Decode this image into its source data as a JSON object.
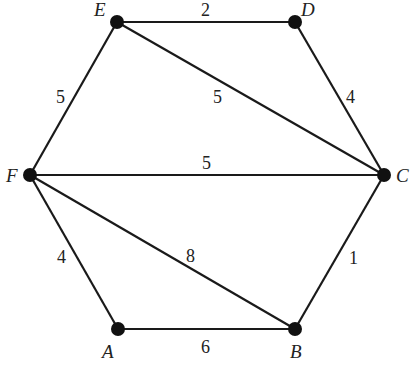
{
  "diagram": {
    "type": "weighted-undirected-graph",
    "nodes": [
      {
        "id": "A",
        "label": "A",
        "x": 118,
        "y": 329,
        "lx": 102,
        "ly": 358
      },
      {
        "id": "B",
        "label": "B",
        "x": 295,
        "y": 329,
        "lx": 290,
        "ly": 358
      },
      {
        "id": "C",
        "label": "C",
        "x": 384,
        "y": 175,
        "lx": 396,
        "ly": 182
      },
      {
        "id": "D",
        "label": "D",
        "x": 295,
        "y": 22,
        "lx": 301,
        "ly": 16
      },
      {
        "id": "E",
        "label": "E",
        "x": 117,
        "y": 22,
        "lx": 94,
        "ly": 16
      },
      {
        "id": "F",
        "label": "F",
        "x": 30,
        "y": 175,
        "lx": 6,
        "ly": 182
      }
    ],
    "edges": [
      {
        "from": "E",
        "to": "D",
        "weight": "2",
        "wx": 201,
        "wy": 16
      },
      {
        "from": "D",
        "to": "C",
        "weight": "4",
        "wx": 346,
        "wy": 103
      },
      {
        "from": "E",
        "to": "C",
        "weight": "5",
        "wx": 213,
        "wy": 103
      },
      {
        "from": "E",
        "to": "F",
        "weight": "5",
        "wx": 56,
        "wy": 103
      },
      {
        "from": "F",
        "to": "C",
        "weight": "5",
        "wx": 202,
        "wy": 169
      },
      {
        "from": "F",
        "to": "A",
        "weight": "4",
        "wx": 57,
        "wy": 263
      },
      {
        "from": "F",
        "to": "B",
        "weight": "8",
        "wx": 186,
        "wy": 262
      },
      {
        "from": "A",
        "to": "B",
        "weight": "6",
        "wx": 201,
        "wy": 353
      },
      {
        "from": "B",
        "to": "C",
        "weight": "1",
        "wx": 349,
        "wy": 264
      }
    ]
  }
}
